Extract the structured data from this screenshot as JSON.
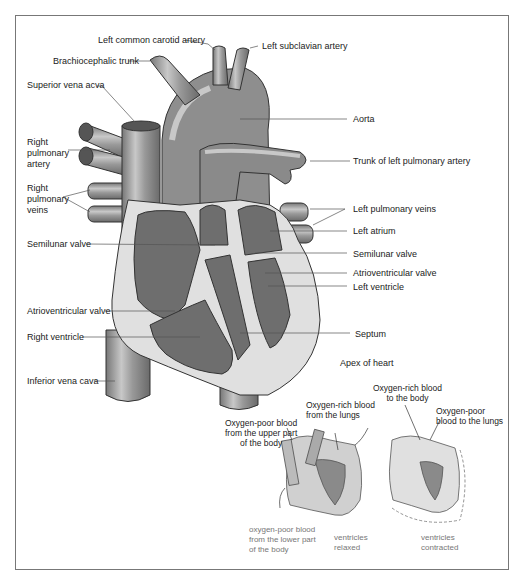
{
  "diagram": {
    "type": "anatomical heart diagram",
    "colors": {
      "vessel": "#8c8c8c",
      "vessel_light": "#c4c4c4",
      "chamber": "#6e6e6e",
      "wall": "#e0e0e0",
      "outline": "#333333",
      "frame": "#777777",
      "leader_line": "#555555"
    },
    "labels": {
      "left_common_carotid": "Left common carotid artery",
      "left_subclavian": "Left subclavian artery",
      "brachiocephalic": "Brachiocephalic trunk",
      "superior_vena_cava": "Superior vena acva",
      "right_pulmonary_artery": [
        "Right",
        "pulmonary",
        "artery"
      ],
      "right_pulmonary_veins": [
        "Right",
        "pulmonary",
        "veins"
      ],
      "semilunar_valve_left": "Semilunar valve",
      "atrioventricular_valve_left": "Atrioventricular valve",
      "right_ventricle": "Right ventricle",
      "inferior_vena_cava": "Inferior vena cava",
      "aorta": "Aorta",
      "trunk_left_pulmonary": "Trunk of left pulmonary artery",
      "left_pulmonary_veins": "Left pulmonary veins",
      "left_atrium": "Left atrium",
      "semilunar_valve_right": "Semilunar valve",
      "atrioventricular_valve_right": "Atrioventricular valve",
      "left_ventricle": "Left ventricle",
      "septum": "Septum",
      "apex": "Apex of heart"
    },
    "inset": {
      "oxygen_poor_upper": [
        "Oxygen-poor blood",
        "from the upper part",
        "of the body"
      ],
      "oxygen_rich_from_lungs": [
        "Oxygen-rich blood",
        "from the lungs"
      ],
      "oxygen_rich_to_body": [
        "Oxygen-rich blood",
        "to the body"
      ],
      "oxygen_poor_to_lungs": [
        "Oxygen-poor",
        "blood to the lungs"
      ],
      "oxygen_poor_lower": [
        "oxygen-poor blood",
        "from the lower part",
        "of the body"
      ],
      "relaxed": [
        "ventricles",
        "relaxed"
      ],
      "contracted": [
        "ventricles",
        "contracted"
      ]
    }
  }
}
